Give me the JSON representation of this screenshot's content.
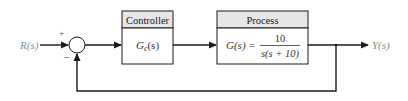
{
  "diagram": {
    "input_label": "R(s)",
    "output_label": "Y(s)",
    "summing_junction": {
      "plus_sign": "+",
      "minus_sign": "−"
    },
    "controller": {
      "title": "Controller",
      "transfer_function": {
        "symbol": "G",
        "subscript": "c",
        "arg": "(s)"
      }
    },
    "process": {
      "title": "Process",
      "lhs": "G(s) =",
      "numerator": "10",
      "denominator": "s(s + 10)"
    },
    "colors": {
      "line": "#1a1a1a",
      "header_fill": "#e6e6e6",
      "label": "#8a8a8a"
    }
  }
}
